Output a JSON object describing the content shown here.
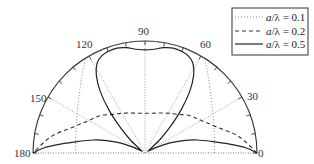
{
  "chart_data": {
    "type": "polar-line",
    "title": "",
    "angular_range_deg": [
      0,
      180
    ],
    "radial_range": [
      0,
      1
    ],
    "angular_tick_labels": [
      "0",
      "30",
      "60",
      "90",
      "120",
      "150",
      "180"
    ],
    "angular_ticks_deg": [
      0,
      30,
      60,
      90,
      120,
      150,
      180
    ],
    "minor_tick_step_deg": 10,
    "grid": "dotted spokes every 30 degrees",
    "legend_position": "top-right",
    "series": [
      {
        "name": "a/λ = 0.1",
        "style": "dotted",
        "color": "#888888",
        "angles_deg": [
          0,
          15,
          30,
          45,
          55,
          60,
          75,
          90,
          105,
          120,
          125,
          135,
          150,
          165,
          180
        ],
        "r": [
          0.62,
          0.64,
          0.7,
          0.82,
          0.95,
          1.0,
          1.0,
          1.0,
          1.0,
          1.0,
          0.95,
          0.82,
          0.7,
          0.64,
          0.62
        ]
      },
      {
        "name": "a/λ = 0.2",
        "style": "dashed",
        "color": "#333333",
        "angles_deg": [
          0,
          10,
          20,
          30,
          40,
          50,
          60,
          70,
          80,
          90,
          100,
          110,
          120,
          130,
          140,
          150,
          160,
          170,
          180
        ],
        "r": [
          1.0,
          0.85,
          0.68,
          0.58,
          0.52,
          0.45,
          0.41,
          0.38,
          0.36,
          0.355,
          0.36,
          0.38,
          0.41,
          0.45,
          0.52,
          0.58,
          0.68,
          0.85,
          1.0
        ]
      },
      {
        "name": "a/λ = 0.5",
        "style": "solid",
        "color": "#222222",
        "angles_deg": [
          0,
          3,
          6,
          10,
          14,
          18,
          22,
          26,
          30,
          36,
          42,
          46,
          50,
          54,
          58,
          62,
          66,
          70,
          75,
          80,
          85,
          90,
          95,
          100,
          105,
          110,
          114,
          118,
          122,
          126,
          130,
          134,
          138,
          144,
          150,
          154,
          158,
          162,
          166,
          170,
          174,
          177,
          180
        ],
        "r": [
          1.0,
          0.9,
          0.76,
          0.6,
          0.48,
          0.36,
          0.24,
          0.12,
          0.04,
          0.05,
          0.18,
          0.32,
          0.5,
          0.68,
          0.82,
          0.91,
          0.95,
          0.965,
          0.97,
          0.955,
          0.93,
          0.92,
          0.93,
          0.955,
          0.97,
          0.965,
          0.95,
          0.91,
          0.82,
          0.68,
          0.5,
          0.32,
          0.18,
          0.05,
          0.04,
          0.12,
          0.24,
          0.36,
          0.48,
          0.6,
          0.76,
          0.9,
          1.0
        ]
      }
    ]
  },
  "legend": {
    "items": [
      {
        "prefix": "a",
        "suffix": "/λ = 0.1",
        "style": "dotted"
      },
      {
        "prefix": "a",
        "suffix": "/λ = 0.2",
        "style": "dashed"
      },
      {
        "prefix": "a",
        "suffix": "/λ = 0.5",
        "style": "solid"
      }
    ]
  },
  "labels": {
    "deg0": "0",
    "deg30": "30",
    "deg60": "60",
    "deg90": "90",
    "deg120": "120",
    "deg150": "150",
    "deg180": "180"
  }
}
